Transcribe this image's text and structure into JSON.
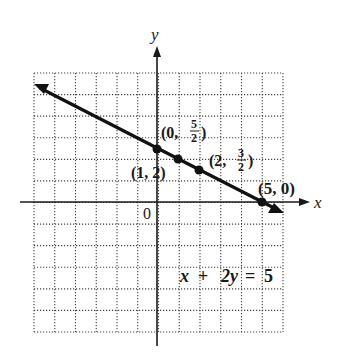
{
  "chart_data": {
    "type": "line",
    "title": "",
    "equation": "x + 2y = 5",
    "xlabel": "x",
    "ylabel": "y",
    "origin_label": "0",
    "xlim": [
      -6,
      6
    ],
    "ylim": [
      -6,
      6
    ],
    "grid": true,
    "grid_style": "dotted",
    "line": {
      "slope": -0.5,
      "intercept": 2.5,
      "arrows": "both"
    },
    "points": [
      {
        "x": 0,
        "y": 2.5,
        "label": "(0, 5/2)"
      },
      {
        "x": 1,
        "y": 2,
        "label": "(1, 2)"
      },
      {
        "x": 2,
        "y": 1.5,
        "label": "(2, 3/2)"
      },
      {
        "x": 5,
        "y": 0,
        "label": "(5, 0)"
      }
    ]
  },
  "labels": {
    "x_axis": "x",
    "y_axis": "y",
    "origin": "0",
    "equation_x": "x",
    "equation_plus": "+",
    "equation_2y": "2y",
    "equation_eq": "=",
    "equation_5": "5",
    "p0_open": "(0,",
    "p0_num": "5",
    "p0_den": "2",
    "p0_close": ")",
    "p1": "(1, 2)",
    "p2_open": "(2,",
    "p2_num": "3",
    "p2_den": "2",
    "p2_close": ")",
    "p3": "(5, 0)"
  }
}
